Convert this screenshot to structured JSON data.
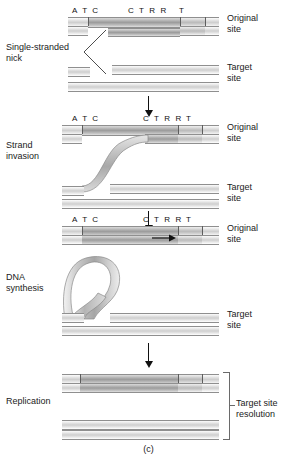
{
  "figure": {
    "caption": "(c)",
    "stages": [
      {
        "id": "single-stranded-nick",
        "label": "Single-stranded\nnick"
      },
      {
        "id": "strand-invasion",
        "label": "Strand\ninvasion"
      },
      {
        "id": "dna-synthesis",
        "label": "DNA\nsynthesis"
      },
      {
        "id": "replication",
        "label": "Replication"
      }
    ],
    "side_labels": {
      "original_site": "Original\nsite",
      "target_site": "Target\nsite",
      "target_site_resolution": "Target site\nresolution"
    },
    "sequence_labels": {
      "left": "A T C",
      "middle": "C T R R",
      "right": "T"
    },
    "colors": {
      "strand_light": "#cfcfcf",
      "strand_mid": "#bcbcbc",
      "strand_dark": "#9d9d9d",
      "outline": "#8f8f8f",
      "arrow": "#111111",
      "text": "#222222",
      "background": "#ffffff"
    },
    "panels": [
      {
        "id": "panel-nick",
        "original_site_label": "Original\nsite",
        "target_site_label": "Target\nsite",
        "sequence": [
          "A T C",
          "C T R R",
          "T"
        ]
      },
      {
        "id": "panel-strand-invasion",
        "original_site_label": "Original\nsite",
        "target_site_label": "Target\nsite",
        "sequence": [
          "A T C",
          "C T R R",
          "T"
        ]
      },
      {
        "id": "panel-dna-synthesis",
        "original_site_label": "Original\nsite",
        "target_site_label": "Target\nsite",
        "sequence": [
          "A T C",
          "C T R R",
          "T"
        ],
        "synthesis_arrow_direction": "right"
      },
      {
        "id": "panel-replication",
        "bracket_label": "Target site\nresolution"
      }
    ]
  }
}
